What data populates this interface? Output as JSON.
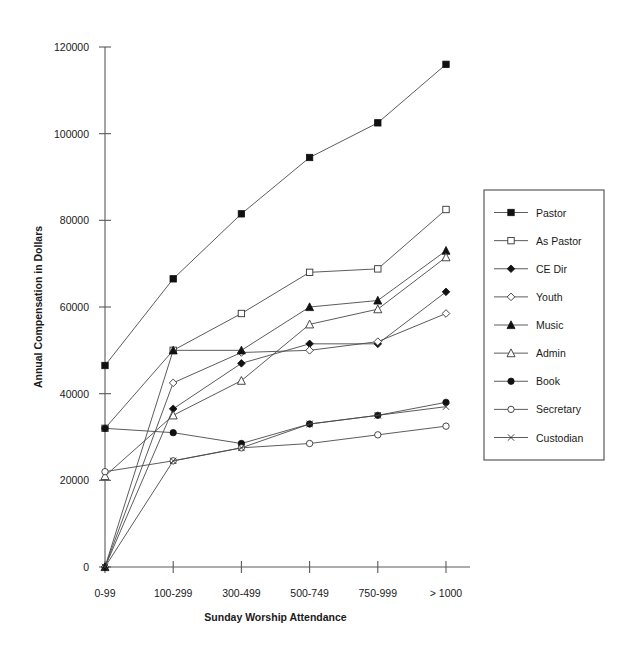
{
  "chart_data": {
    "type": "line",
    "title": "",
    "xlabel": "Sunday Worship Attendance",
    "ylabel": "Annual Compensation in Dollars",
    "categories": [
      "0-99",
      "100-299",
      "300-499",
      "500-749",
      "750-999",
      "> 1000"
    ],
    "ylim": [
      0,
      120000
    ],
    "yticks": [
      0,
      20000,
      40000,
      60000,
      80000,
      100000,
      120000
    ],
    "ytick_labels": [
      "0",
      "20000",
      "40000",
      "60000",
      "80000",
      "100000",
      "120000"
    ],
    "grid": false,
    "legend_position": "right",
    "series": [
      {
        "name": "Pastor",
        "marker": "filled-square",
        "values": [
          46500,
          66500,
          81500,
          94500,
          102500,
          116000
        ]
      },
      {
        "name": "As Pastor",
        "marker": "open-square",
        "values": [
          32000,
          50000,
          58500,
          68000,
          68800,
          82500
        ]
      },
      {
        "name": "CE Dir",
        "marker": "filled-diamond",
        "values": [
          0,
          36500,
          47000,
          51500,
          51500,
          63500
        ]
      },
      {
        "name": "Youth",
        "marker": "open-diamond",
        "values": [
          0,
          42500,
          49500,
          50000,
          52000,
          58500
        ]
      },
      {
        "name": "Music",
        "marker": "filled-triangle",
        "values": [
          0,
          50000,
          50000,
          60000,
          61500,
          73000
        ]
      },
      {
        "name": "Admin",
        "marker": "open-triangle",
        "values": [
          21000,
          35000,
          43000,
          56000,
          59500,
          71500
        ]
      },
      {
        "name": "Book",
        "marker": "filled-circle",
        "values": [
          32000,
          31000,
          28500,
          33000,
          35000,
          38000
        ]
      },
      {
        "name": "Secretary",
        "marker": "open-circle",
        "values": [
          22000,
          24500,
          27500,
          28500,
          30500,
          32500
        ]
      },
      {
        "name": "Custodian",
        "marker": "cross",
        "values": [
          0,
          24500,
          27500,
          33000,
          35000,
          37000
        ]
      }
    ]
  }
}
